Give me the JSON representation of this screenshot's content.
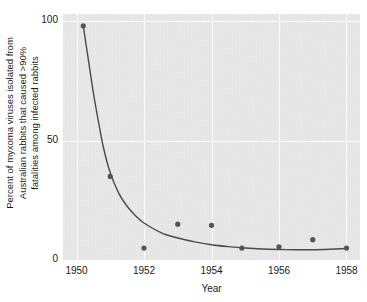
{
  "chart_data": {
    "type": "scatter",
    "title": "",
    "subtitle": "",
    "xlabel": "Year",
    "ylabel": "Percent of myxoma viruses isolated from Australian rabbits that caused >90% fatalities among infected rabbits",
    "ylabel_lines": [
      "Percent of myxoma viruses isolated from",
      "Australian rabbits that caused >90%",
      "fatalities among infected rabbits"
    ],
    "xlim": [
      1949.6,
      1958.4
    ],
    "ylim": [
      0,
      103
    ],
    "xticks": [
      1950,
      1952,
      1954,
      1956,
      1958
    ],
    "xticklabels": [
      "1950",
      "1952",
      "1954",
      "1956",
      "1958"
    ],
    "yticks": [
      0,
      50,
      100
    ],
    "yticklabels": [
      "0",
      "50",
      "100"
    ],
    "grid": true,
    "legend": "none",
    "series": [
      {
        "name": "Observed virulence (% highly lethal isolates)",
        "type": "scatter",
        "marker": "circle",
        "color": "#555555",
        "points": [
          {
            "x": 1950.2,
            "y": 98.0
          },
          {
            "x": 1951.0,
            "y": 35.0
          },
          {
            "x": 1952.0,
            "y": 5.0
          },
          {
            "x": 1953.0,
            "y": 15.0
          },
          {
            "x": 1954.0,
            "y": 14.5
          },
          {
            "x": 1954.9,
            "y": 5.0
          },
          {
            "x": 1956.0,
            "y": 5.5
          },
          {
            "x": 1957.0,
            "y": 8.5
          },
          {
            "x": 1958.0,
            "y": 5.0
          }
        ]
      },
      {
        "name": "Fitted decay curve",
        "type": "line",
        "color": "#4a4a4a",
        "points": [
          {
            "x": 1950.2,
            "y": 98.0
          },
          {
            "x": 1950.35,
            "y": 84.0
          },
          {
            "x": 1950.5,
            "y": 70.0
          },
          {
            "x": 1950.65,
            "y": 58.0
          },
          {
            "x": 1950.8,
            "y": 47.0
          },
          {
            "x": 1951.0,
            "y": 36.5
          },
          {
            "x": 1951.25,
            "y": 28.0
          },
          {
            "x": 1951.5,
            "y": 22.5
          },
          {
            "x": 1951.75,
            "y": 18.5
          },
          {
            "x": 1952.0,
            "y": 15.5
          },
          {
            "x": 1952.5,
            "y": 11.5
          },
          {
            "x": 1953.0,
            "y": 9.2
          },
          {
            "x": 1953.5,
            "y": 7.6
          },
          {
            "x": 1954.0,
            "y": 6.4
          },
          {
            "x": 1954.5,
            "y": 5.6
          },
          {
            "x": 1955.0,
            "y": 5.0
          },
          {
            "x": 1955.5,
            "y": 4.6
          },
          {
            "x": 1956.0,
            "y": 4.4
          },
          {
            "x": 1956.5,
            "y": 4.3
          },
          {
            "x": 1957.0,
            "y": 4.3
          },
          {
            "x": 1957.5,
            "y": 4.5
          },
          {
            "x": 1958.0,
            "y": 4.8
          }
        ]
      }
    ]
  },
  "colors": {
    "panel_background": "#e9e9e9",
    "gridline": "#fbfbfb",
    "marker": "#555555",
    "curve": "#4a4a4a",
    "text": "#1a1a1a",
    "figure_background": "#ffffff"
  }
}
